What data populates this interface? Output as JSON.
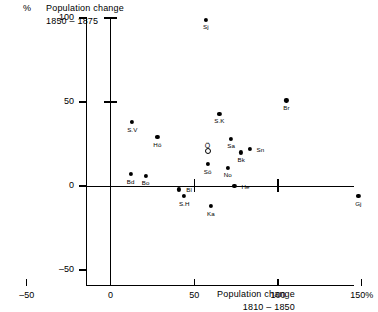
{
  "axes": {
    "y_unit": "%",
    "y_title_line1": "Population change",
    "y_title_line2": "1850 – 1875",
    "x_title_line1": "Population change",
    "x_title_line2": "1810 – 1850",
    "y_ticks": [
      "100",
      "50",
      "0",
      "–50"
    ],
    "x_ticks": [
      "–50",
      "0",
      "50",
      "100",
      "150%"
    ]
  },
  "chart_data": {
    "type": "scatter",
    "title": "Population change 1850 – 1875",
    "xlabel": "Population change 1810 – 1850",
    "ylabel": "Population change 1850 – 1875",
    "xlim": [
      -50,
      150
    ],
    "ylim": [
      -50,
      100
    ],
    "grid": false,
    "legend": "none",
    "x_unit": "%",
    "y_unit": "%",
    "points": [
      {
        "label": "Sj",
        "x": 57,
        "y": 99,
        "marker": "filled",
        "label_pos": "below"
      },
      {
        "label": "Br",
        "x": 105,
        "y": 51,
        "marker": "filled",
        "label_pos": "below"
      },
      {
        "label": "S.K",
        "x": 65,
        "y": 43,
        "marker": "filled",
        "label_pos": "below"
      },
      {
        "label": "S.V",
        "x": 13,
        "y": 38,
        "marker": "filled",
        "label_pos": "below"
      },
      {
        "label": "Hö",
        "x": 28,
        "y": 29,
        "marker": "filled",
        "label_pos": "below"
      },
      {
        "label": "Sa",
        "x": 72,
        "y": 28,
        "marker": "filled",
        "label_pos": "below"
      },
      {
        "label": "Sn",
        "x": 83,
        "y": 22,
        "marker": "filled",
        "label_pos": "right"
      },
      {
        "label": "Bk",
        "x": 78,
        "y": 20,
        "marker": "filled",
        "label_pos": "below"
      },
      {
        "label": "Ö",
        "x": 58,
        "y": 21,
        "marker": "open",
        "label_pos": "none"
      },
      {
        "label": "Sö",
        "x": 58,
        "y": 13,
        "marker": "filled",
        "label_pos": "below"
      },
      {
        "label": "No",
        "x": 70,
        "y": 11,
        "marker": "filled",
        "label_pos": "below"
      },
      {
        "label": "Bd",
        "x": 12,
        "y": 7,
        "marker": "filled",
        "label_pos": "below"
      },
      {
        "label": "Bo",
        "x": 21,
        "y": 6,
        "marker": "filled",
        "label_pos": "below"
      },
      {
        "label": "He",
        "x": 74,
        "y": 0,
        "marker": "filled",
        "label_pos": "right"
      },
      {
        "label": "Bl",
        "x": 41,
        "y": -2,
        "marker": "filled",
        "label_pos": "right"
      },
      {
        "label": "S.H",
        "x": 44,
        "y": -6,
        "marker": "filled",
        "label_pos": "below"
      },
      {
        "label": "Ka",
        "x": 60,
        "y": -12,
        "marker": "filled",
        "label_pos": "below"
      },
      {
        "label": "Gj",
        "x": 148,
        "y": -6,
        "marker": "filled",
        "label_pos": "below"
      }
    ]
  }
}
